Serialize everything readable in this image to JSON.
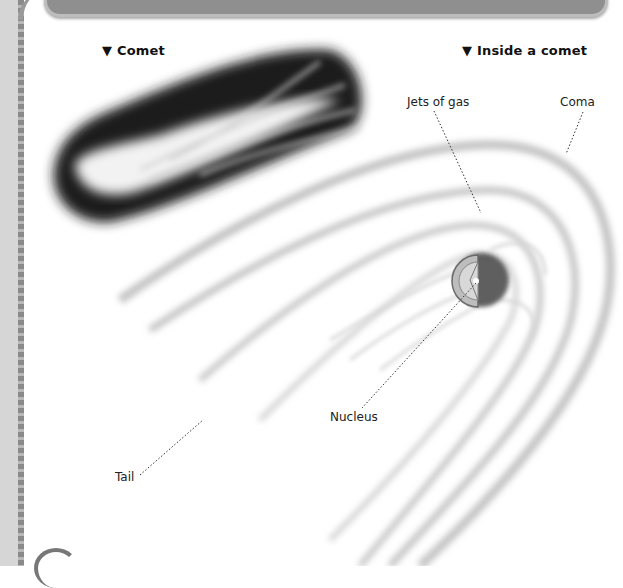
{
  "captions": {
    "left": "▼ Comet",
    "right": "▼ Inside a comet"
  },
  "labels": {
    "jets": "Jets of gas",
    "coma": "Coma",
    "nucleus": "Nucleus",
    "tail": "Tail"
  },
  "colors": {
    "background": "#ffffff",
    "header_bar": "#8f8f8f",
    "margin_strip": "#d6d6d6",
    "text": "#111111"
  }
}
